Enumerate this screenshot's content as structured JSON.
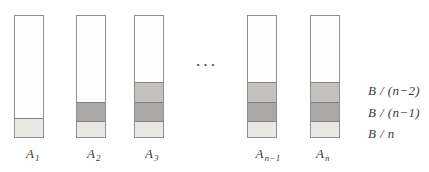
{
  "figure": {
    "ellipsis": "···",
    "bars": [
      {
        "name": "A1",
        "label_base": "A",
        "label_sub": "1",
        "segments": [
          "B/n"
        ]
      },
      {
        "name": "A2",
        "label_base": "A",
        "label_sub": "2",
        "segments": [
          "B/(n-1)",
          "B/n"
        ]
      },
      {
        "name": "A3",
        "label_base": "A",
        "label_sub": "3",
        "segments": [
          "B/(n-2)",
          "B/(n-1)",
          "B/n"
        ]
      },
      {
        "name": "An-1",
        "label_base": "A",
        "label_sub": "n−1",
        "segments": [
          "B/(n-2)",
          "B/(n-1)",
          "B/n"
        ]
      },
      {
        "name": "An",
        "label_base": "A",
        "label_sub": "n",
        "segments": [
          "B/(n-2)",
          "B/(n-1)",
          "B/n"
        ]
      }
    ],
    "row_labels": [
      {
        "text": "B / (n−2)"
      },
      {
        "text": "B / (n−1)"
      },
      {
        "text": "B / n"
      }
    ],
    "colors": {
      "segment_light": "#e9e8e4",
      "segment_mid": "#a9a8a6",
      "segment_top": "#c3c2be",
      "bar_border": "#8f8f8f",
      "text": "#3b3b3b",
      "background": "#ffffff"
    }
  }
}
